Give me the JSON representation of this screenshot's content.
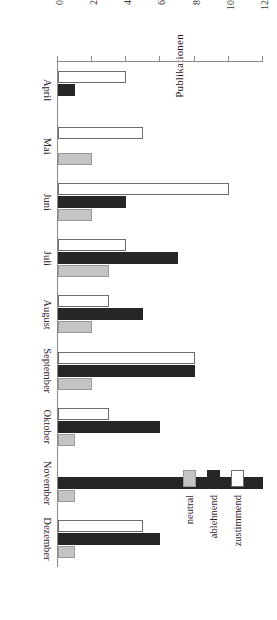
{
  "chart_data": {
    "type": "bar",
    "title": "",
    "subtitle": "",
    "xlabel": "",
    "ylabel": "Publikationen",
    "ylim": [
      0,
      12
    ],
    "yticks": [
      "0",
      "2",
      "4",
      "6",
      "8",
      "10",
      "12"
    ],
    "grid": false,
    "orientation": "vertical-bars-rendered-rotated-90",
    "legend_position": "upper-left-of-rotated-view",
    "categories": [
      "April",
      "Mai",
      "Juni",
      "Juli",
      "August",
      "September",
      "Oktober",
      "November",
      "Dezember"
    ],
    "series": [
      {
        "name": "zustimmend",
        "color": "#ffffff",
        "values": [
          4,
          5,
          10,
          4,
          3,
          8,
          3,
          0,
          5
        ]
      },
      {
        "name": "ablehnend",
        "color": "#262626",
        "values": [
          1,
          0,
          4,
          7,
          5,
          8,
          6,
          12,
          6
        ]
      },
      {
        "name": "neutral",
        "color": "#c4c4c4",
        "values": [
          0,
          2,
          2,
          3,
          2,
          2,
          1,
          1,
          1
        ]
      }
    ],
    "annotations": []
  },
  "legend": {
    "items": [
      {
        "label": "zustimmend",
        "swatch": "white-outline-swatch"
      },
      {
        "label": "ablehnend",
        "swatch": "black-filled-swatch"
      },
      {
        "label": "neutral",
        "swatch": "gray-filled-swatch"
      }
    ]
  },
  "axes": {
    "y_axis_title": "Publikationen",
    "y_tick_labels": [
      "0",
      "2",
      "4",
      "6",
      "8",
      "10",
      "12"
    ],
    "x_tick_labels": [
      "April",
      "Mai",
      "Juni",
      "Juli",
      "August",
      "September",
      "Oktober",
      "November",
      "Dezember"
    ]
  },
  "colors": {
    "axis": "#8a8a8a",
    "text": "#2a2a2a",
    "zustimmend": "#ffffff",
    "ablehnend": "#262626",
    "neutral": "#c4c4c4",
    "background": "#ffffff"
  }
}
